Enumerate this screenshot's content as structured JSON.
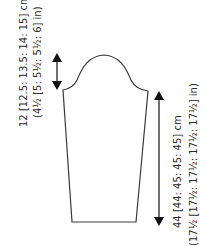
{
  "diagram": {
    "type": "sleeve-schematic",
    "colors": {
      "line": "#3a3a3a",
      "arrow": "#111111",
      "text": "#2b2b2b",
      "background": "#ffffff"
    },
    "cap_height": {
      "line1": "12 [12.5: 13.5: 14: 15] cm",
      "line2": "(4½ [5: 5½: 5½: 6] in)"
    },
    "sleeve_length": {
      "line1": "44 [44: 45: 45: 45] cm",
      "line2": "(17½ [17½: 17½: 17½: 17½] in)"
    }
  }
}
